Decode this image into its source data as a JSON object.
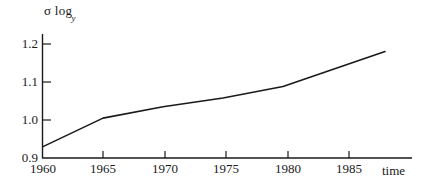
{
  "chart_data": {
    "type": "line",
    "title": "",
    "ylabel": "σ log",
    "ylabel_subscript": "y",
    "xlabel": "time",
    "xlim": [
      1960,
      1989
    ],
    "ylim": [
      0.9,
      1.23
    ],
    "grid": false,
    "legend": null,
    "ytick_labels": [
      "0.9",
      "1.0",
      "1.1",
      "1.2"
    ],
    "ytick_values": [
      0.9,
      1.0,
      1.1,
      1.2
    ],
    "xtick_labels": [
      "1960",
      "1965",
      "1970",
      "1975",
      "1980",
      "1985"
    ],
    "xtick_values": [
      1960,
      1965,
      1970,
      1975,
      1980,
      1985
    ],
    "series": [
      {
        "name": "sigma log y",
        "color": "#1a1a1a",
        "x": [
          1960,
          1965,
          1970,
          1975,
          1980,
          1988.5
        ],
        "values": [
          0.93,
          1.005,
          1.035,
          1.058,
          1.088,
          1.18
        ]
      }
    ]
  },
  "labels": {
    "y_axis_title_main": "σ log",
    "y_axis_title_sub": "y",
    "x_axis_title": "time"
  },
  "style": {
    "line_color": "#1a1a1a",
    "axis_color": "#1a1a1a",
    "background": "#ffffff"
  }
}
